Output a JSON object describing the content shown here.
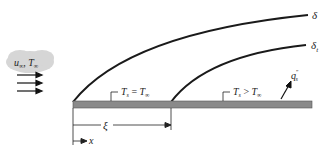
{
  "diagram": {
    "type": "boundary-layer-unheated-starting-length",
    "freestream_label": {
      "u": "u",
      "u_sub": "∞",
      "sep": ", ",
      "T": "T",
      "T_sub": "∞"
    },
    "velocity_boundary_layer": {
      "symbol": "δ"
    },
    "thermal_boundary_layer": {
      "symbol": "δ",
      "sub": "t"
    },
    "unheated_region": {
      "T": "T",
      "T_sub": "s",
      "relation": " = ",
      "T2": "T",
      "T2_sub": "∞"
    },
    "heated_region": {
      "T": "T",
      "T_sub": "s",
      "relation": " > ",
      "T2": "T",
      "T2_sub": "∞"
    },
    "heat_flux": {
      "q": "q",
      "sup": "″",
      "sub": "s"
    },
    "unheated_length": {
      "symbol": "ξ"
    },
    "coordinate": {
      "symbol": "x"
    },
    "colors": {
      "plate": "#8a8a8a",
      "curve": "#1a1a1a",
      "cloud": "#d9d9d9"
    }
  }
}
